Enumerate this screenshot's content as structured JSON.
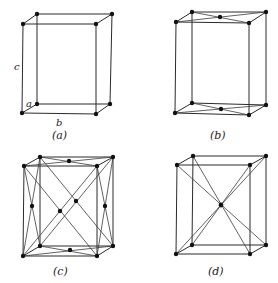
{
  "figure": {
    "panels": [
      {
        "id": "a",
        "label": "(a)",
        "type": "simple (primitive)",
        "axis_labels": {
          "a": "a",
          "b": "b",
          "c": "c"
        }
      },
      {
        "id": "b",
        "label": "(b)",
        "type": "base-centered"
      },
      {
        "id": "c",
        "label": "(c)",
        "type": "face-centered"
      },
      {
        "id": "d",
        "label": "(d)",
        "type": "body-centered"
      }
    ]
  },
  "colors": {
    "line": "#2a2a2a",
    "atom": "#111111",
    "background": "#ffffff"
  }
}
